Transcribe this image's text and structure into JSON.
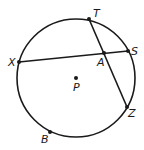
{
  "diagram": {
    "type": "circle-geometry",
    "circle": {
      "center_label": "P"
    },
    "points": [
      {
        "id": "T",
        "label": "T",
        "on_circle": true
      },
      {
        "id": "S",
        "label": "S",
        "on_circle": true
      },
      {
        "id": "X",
        "label": "X",
        "on_circle": true
      },
      {
        "id": "Z",
        "label": "Z",
        "on_circle": true
      },
      {
        "id": "B",
        "label": "B",
        "on_circle": true
      },
      {
        "id": "A",
        "label": "A",
        "on_circle": false,
        "note": "intersection of chords XS and TZ"
      },
      {
        "id": "P",
        "label": "P",
        "on_circle": false,
        "note": "center"
      }
    ],
    "chords": [
      {
        "from": "X",
        "to": "S"
      },
      {
        "from": "T",
        "to": "Z"
      }
    ]
  }
}
